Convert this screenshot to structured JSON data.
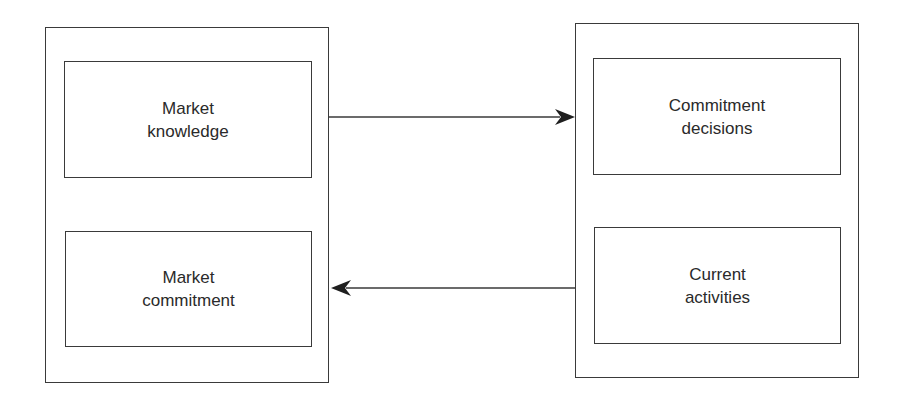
{
  "diagram": {
    "left_group": {
      "boxes": [
        {
          "label": "Market\nknowledge"
        },
        {
          "label": "Market\ncommitment"
        }
      ]
    },
    "right_group": {
      "boxes": [
        {
          "label": "Commitment\ndecisions"
        },
        {
          "label": "Current\nactivities"
        }
      ]
    },
    "arrows": [
      {
        "from": "left_group",
        "to": "right_group",
        "direction": "right",
        "icon": "arrow-right-icon"
      },
      {
        "from": "right_group",
        "to": "left_group",
        "direction": "left",
        "icon": "arrow-left-icon"
      }
    ],
    "colors": {
      "line": "#3a3a3a",
      "text": "#2a2a2a",
      "background": "#ffffff"
    }
  }
}
